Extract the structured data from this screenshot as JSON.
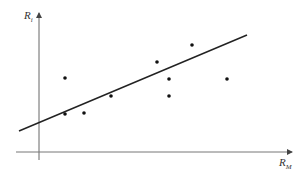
{
  "chart_data": {
    "type": "scatter",
    "title": "",
    "xlabel": "R_M",
    "ylabel": "R_i",
    "grid": false,
    "legend": null,
    "points_px": [
      {
        "x": 65,
        "y": 78
      },
      {
        "x": 65,
        "y": 114
      },
      {
        "x": 84,
        "y": 113
      },
      {
        "x": 111,
        "y": 96
      },
      {
        "x": 157,
        "y": 62
      },
      {
        "x": 169,
        "y": 79
      },
      {
        "x": 169,
        "y": 96
      },
      {
        "x": 192,
        "y": 45
      },
      {
        "x": 227,
        "y": 79
      }
    ],
    "regression_line_px": {
      "x1": 19,
      "y1": 131,
      "x2": 247,
      "y2": 35
    },
    "axes_px": {
      "origin_x": 39,
      "origin_y": 152,
      "x_end": 292,
      "y_end": 12
    }
  },
  "labels": {
    "y_axis": {
      "main": "R",
      "sub": "i"
    },
    "x_axis": {
      "main": "R",
      "sub": "M"
    }
  },
  "colors": {
    "axis": "#555555",
    "line": "#222222",
    "point": "#111111"
  }
}
